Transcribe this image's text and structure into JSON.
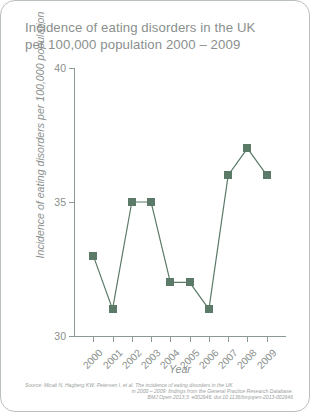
{
  "title": "Incidence of eating disorders in the UK\nper 100,000 population 2000 – 2009",
  "axis": {
    "xtitle": "Year",
    "ytitle": "Incidence of eating disorders per 100,000 population"
  },
  "source": {
    "line1": "Source: Micali N, Hagberg KW, Petersen I, et al. The incidence of eating disorders in the UK",
    "line2": "in 2000 – 2009: findings from the General Practice Research Database.",
    "line3": "BMJ Open 2013;3: e002646. doi:10.1136/bmjopen-2013-002646"
  },
  "colors": {
    "series": "#5b7a68",
    "axis": "#8a9a92",
    "text": "#8a8f8d",
    "border": "#b9bfbc"
  },
  "chart_data": {
    "type": "line",
    "title": "Incidence of eating disorders in the UK per 100,000 population 2000 – 2009",
    "xlabel": "Year",
    "ylabel": "Incidence of eating disorders per 100,000 population",
    "categories": [
      "2000",
      "2001",
      "2002",
      "2003",
      "2004",
      "2005",
      "2006",
      "2007",
      "2008",
      "2009"
    ],
    "values": [
      33,
      31,
      35,
      35,
      32,
      32,
      31,
      36,
      37,
      36
    ],
    "yticks": [
      30,
      35,
      40
    ],
    "ylim": [
      30,
      40
    ],
    "grid": false,
    "legend": false,
    "marker": "square"
  }
}
